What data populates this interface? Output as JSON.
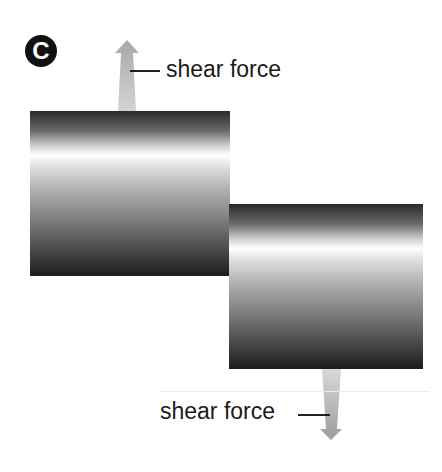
{
  "figure": {
    "panel_label": "C",
    "top_arrow_label": "shear force",
    "bottom_arrow_label": "shear force",
    "colors": {
      "arrow_fill": "#c8c8c8",
      "badge": "#111111",
      "text": "#1a1a1a"
    }
  }
}
